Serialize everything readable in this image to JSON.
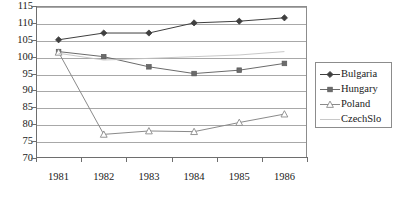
{
  "chart_data": {
    "type": "line",
    "title": "",
    "xlabel": "",
    "ylabel": "",
    "categories": [
      "1981",
      "1982",
      "1983",
      "1984",
      "1985",
      "1986"
    ],
    "ylim": [
      70,
      115
    ],
    "yticks": [
      70,
      75,
      80,
      85,
      90,
      95,
      100,
      105,
      110,
      115
    ],
    "grid": true,
    "legend_position": "right",
    "series": [
      {
        "name": "Bulgaria",
        "marker": "filled-diamond",
        "color": "#3f3f3f",
        "values": [
          105.0,
          107.0,
          107.0,
          110.0,
          110.5,
          111.5
        ]
      },
      {
        "name": "Hungary",
        "marker": "filled-square",
        "color": "#6b6b6b",
        "values": [
          101.5,
          100.0,
          97.0,
          95.0,
          96.0,
          98.0
        ]
      },
      {
        "name": "Poland",
        "marker": "open-triangle",
        "color": "#8a8a8a",
        "values": [
          101.3,
          77.0,
          78.0,
          77.8,
          80.5,
          83.0
        ]
      },
      {
        "name": "CzechSlo",
        "marker": "none",
        "color": "#c2c2c2",
        "values": [
          101.0,
          99.0,
          99.5,
          100.0,
          100.5,
          101.5
        ]
      }
    ]
  },
  "legend": {
    "items": [
      {
        "label": "Bulgaria"
      },
      {
        "label": "Hungary"
      },
      {
        "label": "Poland"
      },
      {
        "label": "CzechSlo"
      }
    ]
  }
}
